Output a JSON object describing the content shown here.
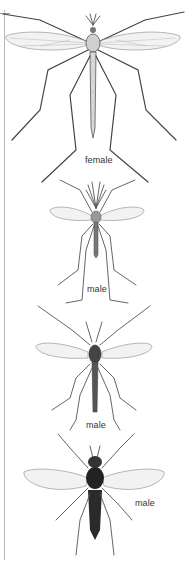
{
  "figure": {
    "specimens": [
      {
        "id": "crane-fly",
        "label": "female"
      },
      {
        "id": "mosquito",
        "label": "male"
      },
      {
        "id": "midge",
        "label": "male"
      },
      {
        "id": "fly",
        "label": "male"
      }
    ]
  },
  "colors": {
    "background": "#ffffff",
    "line": "#444444",
    "label": "#333333"
  }
}
